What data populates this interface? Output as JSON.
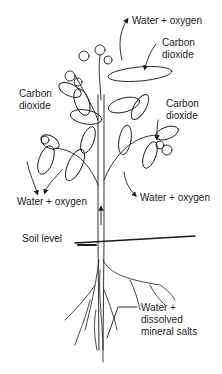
{
  "diagram": {
    "labels": {
      "top_water_oxygen": "Water + oxygen",
      "top_carbon_dioxide_1": "Carbon",
      "top_carbon_dioxide_2": "dioxide",
      "left_carbon_dioxide_1": "Carbon",
      "left_carbon_dioxide_2": "dioxide",
      "right_carbon_dioxide_1": "Carbon",
      "right_carbon_dioxide_2": "dioxide",
      "left_water_oxygen": "Water + oxygen",
      "right_water_oxygen": "Water + oxygen",
      "soil_level": "Soil level",
      "roots_1": "Water +",
      "roots_2": "dissolved",
      "roots_3": "mineral salts"
    },
    "colors": {
      "ink": "#1a1a1a",
      "background": "#ffffff"
    }
  }
}
